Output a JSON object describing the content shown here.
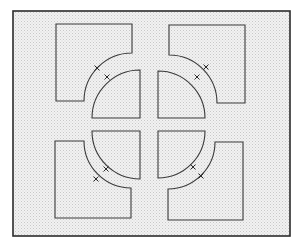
{
  "diagram": {
    "colors": {
      "background": "#ffffff",
      "fill_dot": "#c8c8c8",
      "fill_base": "#f2f2f2",
      "stroke": "#3a3a3a",
      "frame_stroke": "#2b2b2b"
    },
    "frame": {
      "x": 13,
      "y": 11,
      "width": 277,
      "height": 225
    },
    "large_pieces": [
      {
        "name": "top-left",
        "rect": [
          56,
          24,
          132,
          101
        ],
        "notch_corner": "bottom-right",
        "arc_center": [
          132,
          101
        ],
        "radius": 48
      },
      {
        "name": "top-right",
        "rect": [
          169,
          25,
          245,
          103
        ],
        "notch_corner": "bottom-left",
        "arc_center": [
          169,
          103
        ],
        "radius": 48
      },
      {
        "name": "bottom-left",
        "rect": [
          55,
          141,
          131,
          218
        ],
        "notch_corner": "top-right",
        "arc_center": [
          131,
          141
        ],
        "radius": 47
      },
      {
        "name": "bottom-right",
        "rect": [
          168,
          142,
          243,
          220
        ],
        "notch_corner": "top-left",
        "arc_center": [
          168,
          142
        ],
        "radius": 47
      }
    ],
    "quarter_pieces": [
      {
        "name": "top-left",
        "center": [
          140,
          118
        ],
        "radius": 48,
        "orientation": "up-left"
      },
      {
        "name": "top-right",
        "center": [
          158,
          118
        ],
        "radius": 47,
        "orientation": "up-right"
      },
      {
        "name": "bottom-left",
        "center": [
          140,
          131
        ],
        "radius": 48,
        "orientation": "down-left"
      },
      {
        "name": "bottom-right",
        "center": [
          158,
          131
        ],
        "radius": 47,
        "orientation": "down-right"
      }
    ],
    "tick_marks": [
      {
        "x": 97,
        "y": 68
      },
      {
        "x": 107,
        "y": 77
      },
      {
        "x": 206,
        "y": 67
      },
      {
        "x": 197,
        "y": 77
      },
      {
        "x": 96,
        "y": 179
      },
      {
        "x": 106,
        "y": 169
      },
      {
        "x": 193,
        "y": 167
      },
      {
        "x": 201,
        "y": 176
      }
    ]
  }
}
